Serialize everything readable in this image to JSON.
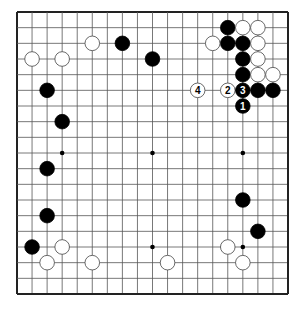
{
  "diagram": {
    "type": "go-board",
    "size": 19,
    "colors": {
      "black": "#000000",
      "white": "#ffffff",
      "line": "#555555",
      "border": "#222222"
    },
    "hoshi": [
      [
        3,
        3
      ],
      [
        9,
        3
      ],
      [
        15,
        3
      ],
      [
        3,
        9
      ],
      [
        9,
        9
      ],
      [
        15,
        9
      ],
      [
        3,
        15
      ],
      [
        9,
        15
      ],
      [
        15,
        15
      ]
    ],
    "stones": [
      {
        "color": "black",
        "col": 7,
        "row": 2
      },
      {
        "color": "black",
        "col": 9,
        "row": 3
      },
      {
        "color": "black",
        "col": 2,
        "row": 5
      },
      {
        "color": "black",
        "col": 3,
        "row": 7
      },
      {
        "color": "black",
        "col": 14,
        "row": 1
      },
      {
        "color": "black",
        "col": 14,
        "row": 2
      },
      {
        "color": "black",
        "col": 15,
        "row": 2
      },
      {
        "color": "black",
        "col": 15,
        "row": 3
      },
      {
        "color": "black",
        "col": 15,
        "row": 4
      },
      {
        "color": "black",
        "col": 16,
        "row": 5
      },
      {
        "color": "black",
        "col": 17,
        "row": 5
      },
      {
        "color": "black",
        "col": 15,
        "row": 12
      },
      {
        "color": "black",
        "col": 16,
        "row": 14
      },
      {
        "color": "black",
        "col": 2,
        "row": 10
      },
      {
        "color": "black",
        "col": 2,
        "row": 13
      },
      {
        "color": "black",
        "col": 1,
        "row": 15
      },
      {
        "color": "white",
        "col": 1,
        "row": 3
      },
      {
        "color": "white",
        "col": 3,
        "row": 3
      },
      {
        "color": "white",
        "col": 5,
        "row": 2
      },
      {
        "color": "white",
        "col": 13,
        "row": 2
      },
      {
        "color": "white",
        "col": 15,
        "row": 1
      },
      {
        "color": "white",
        "col": 16,
        "row": 1
      },
      {
        "color": "white",
        "col": 16,
        "row": 2
      },
      {
        "color": "white",
        "col": 16,
        "row": 3
      },
      {
        "color": "white",
        "col": 16,
        "row": 4
      },
      {
        "color": "white",
        "col": 17,
        "row": 4
      },
      {
        "color": "white",
        "col": 14,
        "row": 15
      },
      {
        "color": "white",
        "col": 15,
        "row": 16
      },
      {
        "color": "white",
        "col": 3,
        "row": 15
      },
      {
        "color": "white",
        "col": 2,
        "row": 16
      },
      {
        "color": "white",
        "col": 5,
        "row": 16
      },
      {
        "color": "white",
        "col": 10,
        "row": 16
      },
      {
        "color": "black",
        "col": 15,
        "row": 6,
        "label": "1"
      },
      {
        "color": "white",
        "col": 14,
        "row": 5,
        "label": "2"
      },
      {
        "color": "black",
        "col": 15,
        "row": 5,
        "label": "3"
      },
      {
        "color": "white",
        "col": 12,
        "row": 5,
        "label": "4"
      }
    ]
  }
}
